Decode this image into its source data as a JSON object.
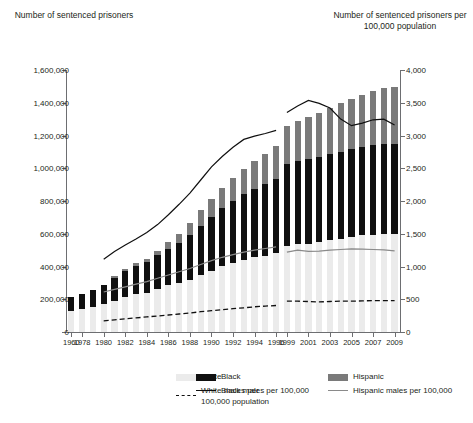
{
  "chart_data": {
    "type": "bar",
    "title": "",
    "ylabel": "Number of sentenced prisoners",
    "ylabel_right": "Number of sentenced prisoners per 100,000 population",
    "xlabel": "",
    "ylim": [
      0,
      1600000
    ],
    "ylim_right": [
      0,
      4000
    ],
    "ytick_labels": [
      "0",
      "200,000",
      "400,000",
      "600,000",
      "800,000",
      "1,000,000",
      "1,200,000",
      "1,400,000",
      "1,600,000"
    ],
    "ytick_values": [
      0,
      200000,
      400000,
      600000,
      800000,
      1000000,
      1200000,
      1400000,
      1600000
    ],
    "ytick_labels_right": [
      "0",
      "500",
      "1,000",
      "1,500",
      "2,000",
      "2,500",
      "3,000",
      "3,500",
      "4,000"
    ],
    "ytick_values_right": [
      0,
      500,
      1000,
      1500,
      2000,
      2500,
      3000,
      3500,
      4000
    ],
    "grid": false,
    "legend_position": "bottom",
    "x": [
      "1960",
      "1978",
      "1979",
      "1980",
      "1981",
      "1982",
      "1983",
      "1984",
      "1985",
      "1986",
      "1987",
      "1988",
      "1989",
      "1990",
      "1991",
      "1992",
      "1993",
      "1994",
      "1995",
      "1996",
      "1999",
      "2000",
      "2001",
      "2002",
      "2003",
      "2004",
      "2005",
      "2006",
      "2007",
      "2008",
      "2009"
    ],
    "xtick_labels": [
      "1960",
      "1978",
      "1980",
      "1982",
      "1984",
      "1986",
      "1988",
      "1990",
      "1992",
      "1994",
      "1996",
      "1999",
      "2001",
      "2003",
      "2005",
      "2007",
      "2009"
    ],
    "stacked_series": [
      {
        "name": "White",
        "color": "#ebebeb",
        "values": [
          130000,
          140000,
          150000,
          170000,
          190000,
          215000,
          230000,
          240000,
          265000,
          285000,
          300000,
          320000,
          350000,
          370000,
          400000,
          420000,
          440000,
          455000,
          465000,
          480000,
          525000,
          535000,
          540000,
          550000,
          560000,
          570000,
          580000,
          590000,
          595000,
          600000,
          600000
        ]
      },
      {
        "name": "Black",
        "color": "#101010",
        "values": [
          85000,
          95000,
          105000,
          120000,
          140000,
          160000,
          175000,
          185000,
          205000,
          225000,
          245000,
          270000,
          300000,
          330000,
          355000,
          380000,
          400000,
          420000,
          440000,
          455000,
          500000,
          510000,
          515000,
          520000,
          525000,
          530000,
          535000,
          540000,
          545000,
          550000,
          550000
        ]
      },
      {
        "name": "Hispanic",
        "color": "#7a7a7a",
        "values": [
          0,
          0,
          0,
          0,
          10000,
          12000,
          15000,
          18000,
          25000,
          40000,
          55000,
          75000,
          95000,
          110000,
          125000,
          140000,
          155000,
          170000,
          185000,
          200000,
          230000,
          245000,
          255000,
          270000,
          285000,
          300000,
          310000,
          320000,
          330000,
          340000,
          345000
        ]
      }
    ],
    "line_series": [
      {
        "name": "White males per 100,000 population",
        "color": "#101010",
        "style": "dashed",
        "axis": "right",
        "start_index": 3,
        "values": [
          null,
          null,
          null,
          170,
          185,
          200,
          215,
          230,
          245,
          260,
          275,
          290,
          310,
          325,
          340,
          355,
          370,
          385,
          395,
          405,
          470,
          470,
          465,
          460,
          465,
          470,
          470,
          475,
          480,
          480,
          480
        ]
      },
      {
        "name": "Black males per 100,000",
        "color": "#101010",
        "style": "solid",
        "axis": "right",
        "start_index": 3,
        "values": [
          null,
          null,
          null,
          1110,
          1230,
          1330,
          1420,
          1520,
          1640,
          1790,
          1950,
          2120,
          2320,
          2520,
          2680,
          2820,
          2940,
          2990,
          3030,
          3080,
          3350,
          3450,
          3535,
          3490,
          3420,
          3250,
          3150,
          3190,
          3240,
          3250,
          3160
        ]
      },
      {
        "name": "Hispanic males per 100,000",
        "color": "#8a8a8a",
        "style": "solid",
        "axis": "right",
        "start_index": 3,
        "values": [
          null,
          null,
          null,
          610,
          650,
          690,
          730,
          770,
          820,
          870,
          920,
          970,
          1030,
          1090,
          1140,
          1180,
          1220,
          1250,
          1275,
          1300,
          1220,
          1250,
          1230,
          1235,
          1250,
          1260,
          1270,
          1265,
          1260,
          1255,
          1240
        ]
      }
    ],
    "legend": [
      {
        "label": "White",
        "kind": "swatch",
        "color": "#ebebeb"
      },
      {
        "label": "White males per 100,000 population",
        "kind": "dashed-line",
        "color": "#101010"
      },
      {
        "label": "Black",
        "kind": "swatch",
        "color": "#101010"
      },
      {
        "label": "Black males per 100,000",
        "kind": "solid-line",
        "color": "#101010"
      },
      {
        "label": "Hispanic",
        "kind": "swatch",
        "color": "#7a7a7a"
      },
      {
        "label": "Hispanic males per 100,000",
        "kind": "solid-line",
        "color": "#8a8a8a"
      }
    ]
  },
  "legend_text": {
    "white": "White",
    "white_line_l1": "White males per",
    "white_line_l2": "100,000 population",
    "black": "Black",
    "black_line": "Black males per 100,000",
    "hispanic": "Hispanic",
    "hispanic_line": "Hispanic males per 100,000"
  },
  "titles": {
    "left": "Number of sentenced prisoners",
    "right": "Number of sentenced prisoners per 100,000 population"
  }
}
